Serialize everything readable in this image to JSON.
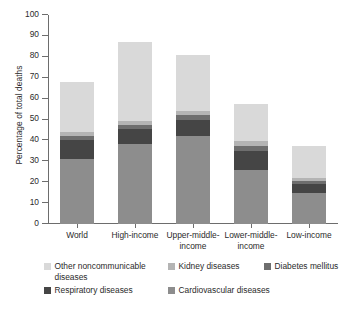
{
  "chart_data": {
    "type": "bar",
    "subtype": "stacked-vertical",
    "title": "",
    "xlabel": "",
    "ylabel": "Percentage of total deaths",
    "ylim": [
      0,
      100
    ],
    "ytick_labels": [
      "0",
      "10",
      "20",
      "30",
      "40",
      "50",
      "60",
      "70",
      "80",
      "90",
      "100"
    ],
    "ytick_values": [
      0,
      10,
      20,
      30,
      40,
      50,
      60,
      70,
      80,
      90,
      100
    ],
    "grid": false,
    "legend_position": "bottom",
    "categories": [
      "World",
      "High-income",
      "Upper-middle-income",
      "Lower-middle-income",
      "Low-income"
    ],
    "series": [
      {
        "name": "Cardiovascular diseases",
        "color": "#8d8d8d",
        "values": [
          31,
          38.5,
          42,
          26,
          15
        ]
      },
      {
        "name": "Respiratory diseases",
        "color": "#454545",
        "values": [
          9,
          7,
          8,
          9,
          4
        ]
      },
      {
        "name": "Diabetes mellitus",
        "color": "#6e6e6e",
        "values": [
          2,
          2,
          2,
          2.5,
          1.5
        ]
      },
      {
        "name": "Kidney diseases",
        "color": "#b4b4b4",
        "values": [
          2,
          2,
          2,
          2,
          1.5
        ]
      },
      {
        "name": "Other noncommunicable diseases",
        "color": "#d9d9d9",
        "values": [
          24,
          37.5,
          27,
          18,
          15.5
        ]
      }
    ],
    "totals": [
      68,
      87,
      81,
      57.5,
      37.5
    ]
  },
  "axis": {
    "y_title": "Percentage of total deaths"
  },
  "legend": {
    "entries": [
      {
        "label": "Other noncommunicable diseases",
        "color": "#d9d9d9"
      },
      {
        "label": "Kidney diseases",
        "color": "#b4b4b4"
      },
      {
        "label": "Diabetes mellitus",
        "color": "#6e6e6e"
      },
      {
        "label": "Respiratory diseases",
        "color": "#454545"
      },
      {
        "label": "Cardiovascular diseases",
        "color": "#8d8d8d"
      }
    ]
  },
  "xlabels": [
    {
      "line1": "World",
      "line2": ""
    },
    {
      "line1": "High-income",
      "line2": ""
    },
    {
      "line1": "Upper-middle-",
      "line2": "income"
    },
    {
      "line1": "Lower-middle-",
      "line2": "income"
    },
    {
      "line1": "Low-income",
      "line2": ""
    }
  ]
}
